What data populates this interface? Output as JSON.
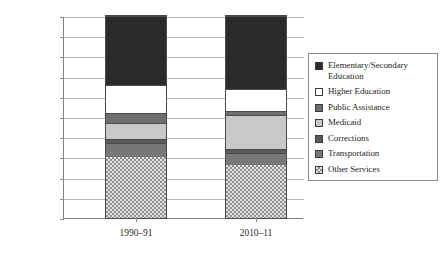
{
  "chart_data": {
    "type": "bar",
    "subtype": "stacked-percentage",
    "title": "",
    "xlabel": "",
    "ylabel": "",
    "ylim": [
      0,
      100
    ],
    "y_unit": "%",
    "grid": true,
    "legend_position": "right",
    "categories": [
      "1990–91",
      "2010–11"
    ],
    "ytick_labels": [
      "0%",
      "10%",
      "20%",
      "30%",
      "40%",
      "50%",
      "60%",
      "70%",
      "80%",
      "90%",
      "100%"
    ],
    "ytick_values": [
      0,
      10,
      20,
      30,
      40,
      50,
      60,
      70,
      80,
      90,
      100
    ],
    "stack_order_bottom_to_top": [
      "Other Services",
      "Transportation",
      "Corrections",
      "Medicaid",
      "Public Assistance",
      "Higher Education",
      "Elementary/Secondary Education"
    ],
    "series": [
      {
        "name": "Elementary/Secondary Education",
        "values": [
          34,
          36
        ],
        "color": "#2b2b2b",
        "pattern": "solid"
      },
      {
        "name": "Higher Education",
        "values": [
          14,
          11
        ],
        "color": "#ffffff",
        "pattern": "solid"
      },
      {
        "name": "Public Assistance",
        "values": [
          5,
          2
        ],
        "color": "#6e6e6e",
        "pattern": "solid"
      },
      {
        "name": "Medicaid",
        "values": [
          8,
          17
        ],
        "color": "#c9c9c9",
        "pattern": "solid"
      },
      {
        "name": "Corrections",
        "values": [
          2,
          2
        ],
        "color": "#5a5a5a",
        "pattern": "solid"
      },
      {
        "name": "Transportation",
        "values": [
          7,
          6
        ],
        "color": "#787878",
        "pattern": "solid"
      },
      {
        "name": "Other Services",
        "values": [
          30,
          26
        ],
        "color": "#e2e2e2",
        "pattern": "checker"
      }
    ],
    "cumulative_boundaries": {
      "1990–91": [
        0,
        30,
        37,
        39,
        47,
        52,
        66,
        100
      ],
      "2010–11": [
        0,
        26,
        32,
        34,
        51,
        53,
        64,
        100
      ]
    }
  },
  "legend": {
    "items": [
      {
        "label": "Elementary/Secondary Education",
        "swatch": "#2b2b2b",
        "pattern": "solid"
      },
      {
        "label": "Higher Education",
        "swatch": "#ffffff",
        "pattern": "solid"
      },
      {
        "label": "Public Assistance",
        "swatch": "#6e6e6e",
        "pattern": "solid"
      },
      {
        "label": "Medicaid",
        "swatch": "#c9c9c9",
        "pattern": "solid"
      },
      {
        "label": "Corrections",
        "swatch": "#5a5a5a",
        "pattern": "solid"
      },
      {
        "label": "Transportation",
        "swatch": "#787878",
        "pattern": "solid"
      },
      {
        "label": "Other Services",
        "swatch": "#e2e2e2",
        "pattern": "checker"
      }
    ]
  }
}
